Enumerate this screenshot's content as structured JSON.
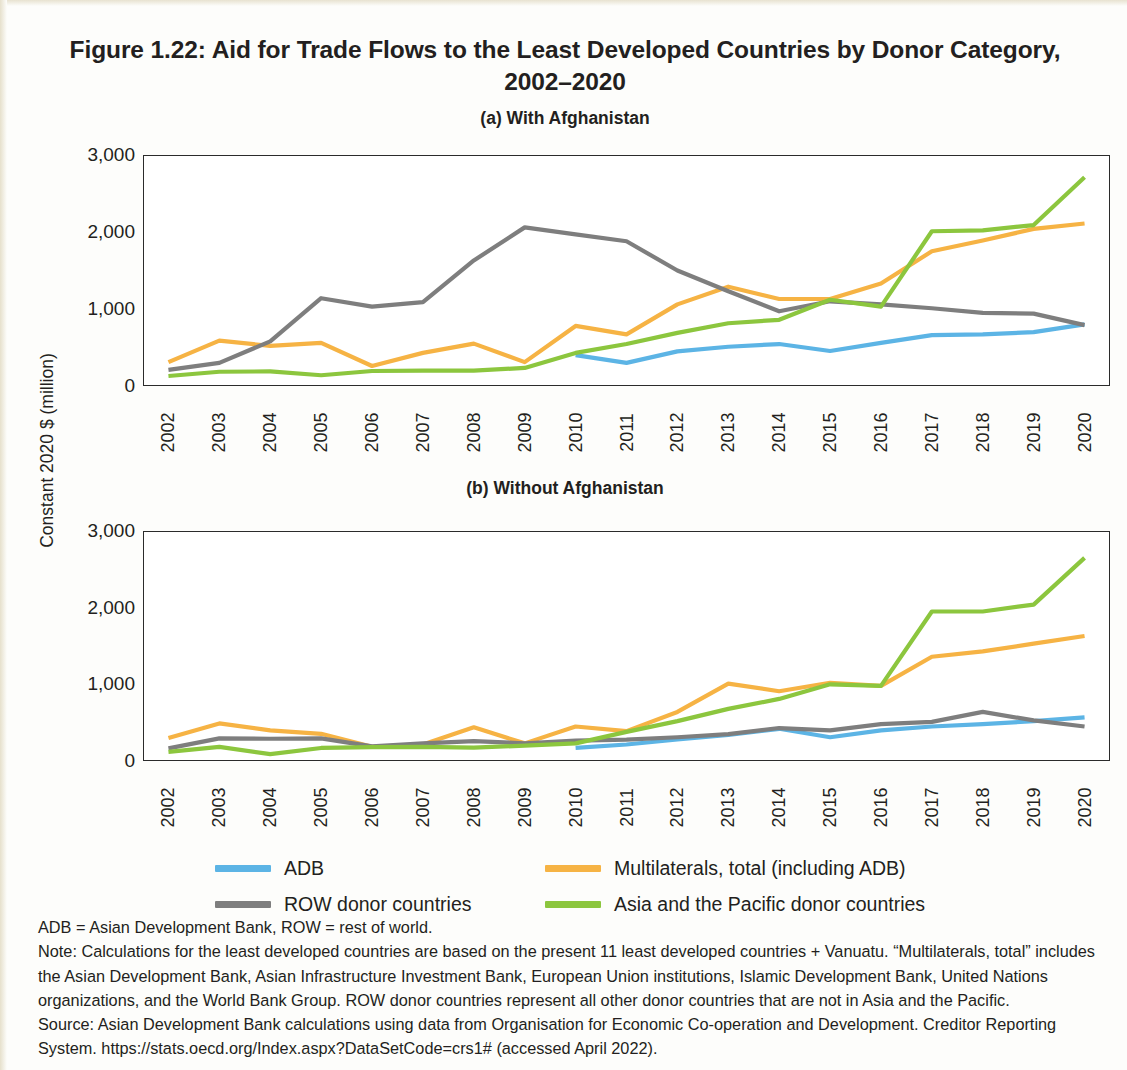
{
  "figure": {
    "title": "Figure 1.22: Aid for Trade Flows to the Least Developed Countries by Donor Category, 2002–2020",
    "panel_a_title": "(a) With Afghanistan",
    "panel_b_title": "(b) Without Afghanistan",
    "y_axis_label": "Constant 2020 $ (million)"
  },
  "legend": {
    "items": [
      {
        "label": "ADB",
        "color": "#5CB4E5"
      },
      {
        "label": "Multilaterals, total (including ADB)",
        "color": "#F6B344"
      },
      {
        "label": "ROW donor countries",
        "color": "#7E7E7E"
      },
      {
        "label": "Asia and the Pacific donor countries",
        "color": "#8CC63E"
      }
    ]
  },
  "notes": {
    "abbreviations": "ADB = Asian Development Bank, ROW = rest of world.",
    "note": "Note: Calculations for the least developed countries are based on the present 11 least developed countries + Vanuatu. “Multilaterals, total” includes the Asian Development Bank, Asian Infrastructure Investment Bank, European Union institutions, Islamic Development Bank, United Nations organizations, and the World Bank Group. ROW donor countries represent all other donor countries that are not in Asia and the Pacific.",
    "source": "Source: Asian Development Bank calculations using data from Organisation for Economic Co-operation and Development. Creditor Reporting System. https://stats.oecd.org/Index.aspx?DataSetCode=crs1# (accessed April 2022)."
  },
  "chart_data": [
    {
      "type": "line",
      "id": "a",
      "title": "(a) With Afghanistan",
      "xlabel": "",
      "ylabel": "Constant 2020 $ (million)",
      "ylim": [
        0,
        3000
      ],
      "yticks": [
        "0",
        "1,000",
        "2,000",
        "3,000"
      ],
      "ytick_values": [
        0,
        1000,
        2000,
        3000
      ],
      "grid": false,
      "legend_position": "bottom",
      "categories": [
        "2002",
        "2003",
        "2004",
        "2005",
        "2006",
        "2007",
        "2008",
        "2009",
        "2010",
        "2011",
        "2012",
        "2013",
        "2014",
        "2015",
        "2016",
        "2017",
        "2018",
        "2019",
        "2020"
      ],
      "series": [
        {
          "name": "ADB",
          "color": "#5CB4E5",
          "values": [
            null,
            null,
            null,
            null,
            null,
            null,
            null,
            null,
            400,
            300,
            450,
            510,
            545,
            455,
            560,
            660,
            670,
            700,
            800
          ]
        },
        {
          "name": "Multilaterals, total (including ADB)",
          "color": "#F6B344",
          "values": [
            310,
            590,
            520,
            560,
            260,
            430,
            550,
            310,
            780,
            670,
            1060,
            1290,
            1130,
            1130,
            1330,
            1750,
            1890,
            2040,
            2110
          ]
        },
        {
          "name": "ROW donor countries",
          "color": "#7E7E7E",
          "values": [
            210,
            300,
            580,
            1140,
            1030,
            1090,
            1630,
            2060,
            1970,
            1880,
            1500,
            1230,
            970,
            1100,
            1060,
            1010,
            950,
            940,
            790
          ]
        },
        {
          "name": "Asia and the Pacific donor countries",
          "color": "#8CC63E",
          "values": [
            130,
            185,
            190,
            140,
            195,
            200,
            200,
            235,
            430,
            545,
            690,
            815,
            860,
            1120,
            1030,
            2010,
            2020,
            2090,
            2710
          ]
        }
      ]
    },
    {
      "type": "line",
      "id": "b",
      "title": "(b) Without Afghanistan",
      "xlabel": "",
      "ylabel": "Constant 2020 $ (million)",
      "ylim": [
        0,
        3000
      ],
      "yticks": [
        "0",
        "1,000",
        "2,000",
        "3,000"
      ],
      "ytick_values": [
        0,
        1000,
        2000,
        3000
      ],
      "grid": false,
      "legend_position": "bottom",
      "categories": [
        "2002",
        "2003",
        "2004",
        "2005",
        "2006",
        "2007",
        "2008",
        "2009",
        "2010",
        "2011",
        "2012",
        "2013",
        "2014",
        "2015",
        "2016",
        "2017",
        "2018",
        "2019",
        "2020"
      ],
      "series": [
        {
          "name": "ADB",
          "color": "#5CB4E5",
          "values": [
            null,
            null,
            null,
            null,
            null,
            null,
            null,
            null,
            170,
            215,
            280,
            340,
            420,
            310,
            400,
            450,
            480,
            520,
            570
          ]
        },
        {
          "name": "Multilaterals, total (including ADB)",
          "color": "#F6B344",
          "values": [
            300,
            490,
            400,
            355,
            185,
            215,
            440,
            230,
            450,
            390,
            640,
            1010,
            910,
            1020,
            980,
            1360,
            1430,
            1530,
            1630
          ]
        },
        {
          "name": "ROW donor countries",
          "color": "#7E7E7E",
          "values": [
            165,
            295,
            290,
            295,
            190,
            230,
            260,
            230,
            265,
            280,
            310,
            350,
            430,
            400,
            480,
            510,
            640,
            530,
            450
          ]
        },
        {
          "name": "Asia and the Pacific donor countries",
          "color": "#8CC63E",
          "values": [
            120,
            185,
            90,
            170,
            180,
            185,
            175,
            200,
            230,
            380,
            520,
            680,
            810,
            1000,
            980,
            1950,
            1950,
            2040,
            2650
          ]
        }
      ]
    }
  ]
}
